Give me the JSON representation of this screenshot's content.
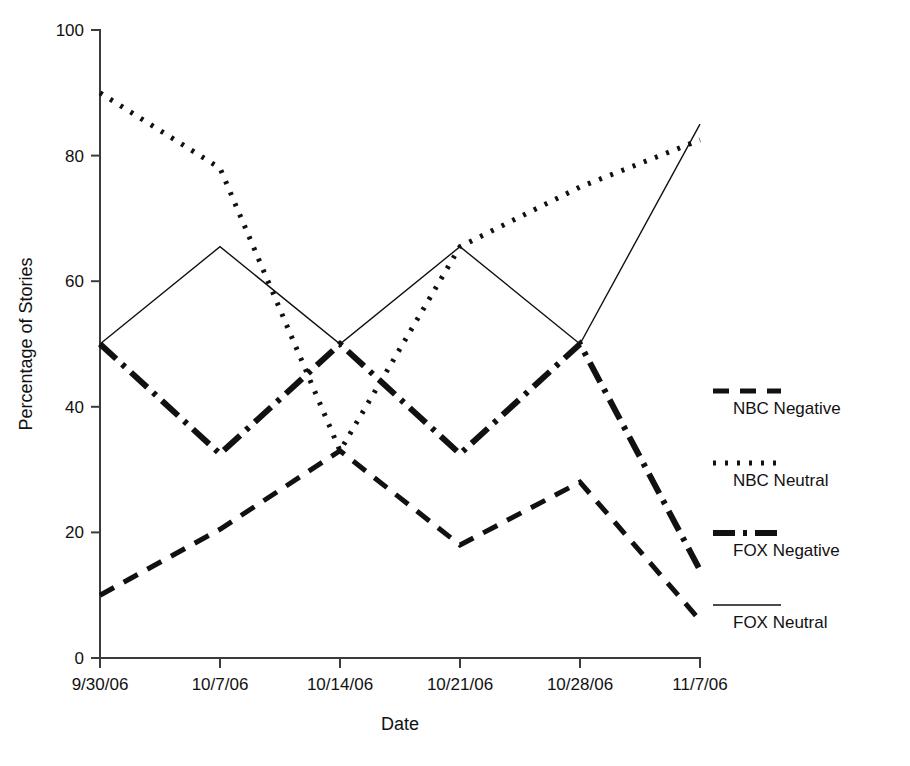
{
  "chart_data": {
    "type": "line",
    "title": "",
    "xlabel": "Date",
    "ylabel": "Percentage of Stories",
    "categories": [
      "9/30/06",
      "10/7/06",
      "10/14/06",
      "10/21/06",
      "10/28/06",
      "11/7/06"
    ],
    "x_tick_labels": [
      "9/30/06",
      "10/7/06",
      "10/14/06",
      "10/21/06",
      "10/28/06",
      "11/7/06"
    ],
    "y_tick_labels": [
      "0",
      "20",
      "40",
      "60",
      "80",
      "100"
    ],
    "y_ticks": [
      0,
      20,
      40,
      60,
      80,
      100
    ],
    "ylim": [
      0,
      100
    ],
    "grid": false,
    "legend_position": "right",
    "series": [
      {
        "name": "NBC Negative",
        "style": "dashed",
        "stroke_width": 5,
        "dash_array": "16 11",
        "values": [
          10,
          20.5,
          33,
          18,
          28,
          6
        ]
      },
      {
        "name": "NBC Neutral",
        "style": "dotted",
        "stroke_width": 5,
        "dash_array": "3 9",
        "values": [
          90,
          78,
          33,
          65.5,
          75,
          82.5
        ]
      },
      {
        "name": "FOX Negative",
        "style": "dash-dot",
        "stroke_width": 6,
        "dash_array": "22 8 4 8",
        "values": [
          50,
          32.5,
          50,
          32.5,
          50,
          14
        ]
      },
      {
        "name": "FOX Neutral",
        "style": "solid",
        "stroke_width": 1.4,
        "dash_array": "",
        "values": [
          50,
          65.5,
          50,
          65.5,
          50,
          85
        ]
      }
    ]
  },
  "legend": {
    "items": [
      {
        "label": "NBC Negative",
        "sample": "dashed"
      },
      {
        "label": "NBC Neutral",
        "sample": "dotted"
      },
      {
        "label": "FOX Negative",
        "sample": "dash-dot"
      },
      {
        "label": "FOX Neutral",
        "sample": "solid"
      }
    ]
  }
}
